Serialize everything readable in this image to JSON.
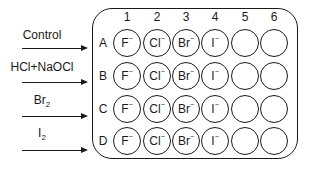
{
  "treatments": [
    {
      "label": "Control",
      "row": "A"
    },
    {
      "label": "HCl+NaOCl",
      "row": "B"
    },
    {
      "label": "Br",
      "sub": "2",
      "row": "C"
    },
    {
      "label": "I",
      "sub": "2",
      "row": "D"
    }
  ],
  "plate": {
    "columns": [
      "1",
      "2",
      "3",
      "4",
      "5",
      "6"
    ],
    "rows": [
      "A",
      "B",
      "C",
      "D"
    ],
    "wells": {
      "A": [
        {
          "ion": "F",
          "charge": "−"
        },
        {
          "ion": "Cl",
          "charge": "−"
        },
        {
          "ion": "Br",
          "charge": "−"
        },
        {
          "ion": "I",
          "charge": "−"
        },
        {
          "ion": "",
          "charge": ""
        },
        {
          "ion": "",
          "charge": ""
        }
      ],
      "B": [
        {
          "ion": "F",
          "charge": "−"
        },
        {
          "ion": "Cl",
          "charge": "−"
        },
        {
          "ion": "Br",
          "charge": "−"
        },
        {
          "ion": "I",
          "charge": "−"
        },
        {
          "ion": "",
          "charge": ""
        },
        {
          "ion": "",
          "charge": ""
        }
      ],
      "C": [
        {
          "ion": "F",
          "charge": "−"
        },
        {
          "ion": "Cl",
          "charge": "−"
        },
        {
          "ion": "Br",
          "charge": "−"
        },
        {
          "ion": "I",
          "charge": "−"
        },
        {
          "ion": "",
          "charge": ""
        },
        {
          "ion": "",
          "charge": ""
        }
      ],
      "D": [
        {
          "ion": "F",
          "charge": "−"
        },
        {
          "ion": "Cl",
          "charge": "−"
        },
        {
          "ion": "Br",
          "charge": "−"
        },
        {
          "ion": "I",
          "charge": "−"
        },
        {
          "ion": "",
          "charge": ""
        },
        {
          "ion": "",
          "charge": ""
        }
      ]
    }
  }
}
